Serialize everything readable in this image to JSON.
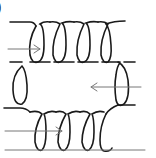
{
  "diagram": {
    "panel_label": ")",
    "colors": {
      "wire": "#1a1a1a",
      "arrow": "#777777",
      "background": "#ffffff"
    },
    "arrows": [
      {
        "name": "top-arrow",
        "direction": "right"
      },
      {
        "name": "right-arrow",
        "direction": "left"
      },
      {
        "name": "bottom-arrow",
        "direction": "right"
      }
    ],
    "coils": {
      "top_turns": 4,
      "bottom_turns": 4,
      "left_side_turns": 1,
      "right_side_turns": 1
    }
  }
}
